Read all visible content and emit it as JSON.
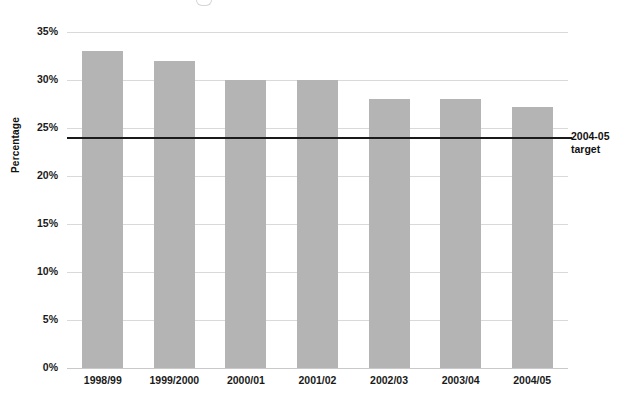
{
  "chart_data": {
    "type": "bar",
    "title": "",
    "xlabel": "",
    "ylabel": "Percentage",
    "categories": [
      "1998/99",
      "1999/2000",
      "2000/01",
      "2001/02",
      "2002/03",
      "2003/04",
      "2004/05"
    ],
    "values": [
      33,
      32,
      30,
      30,
      28,
      28,
      27.2
    ],
    "ylim": [
      0,
      35
    ],
    "ytick_labels": [
      "0%",
      "5%",
      "10%",
      "15%",
      "20%",
      "25%",
      "30%",
      "35%"
    ],
    "ytick_values": [
      0,
      5,
      10,
      15,
      20,
      25,
      30,
      35
    ],
    "grid": true,
    "legend": "none",
    "series": [
      {
        "name": "Percentage",
        "values": [
          33,
          32,
          30,
          30,
          28,
          28,
          27.2
        ]
      }
    ],
    "annotations": [
      {
        "type": "threshold-line",
        "label_line1": "2004-05",
        "label_line2": "target",
        "value": 24
      }
    ],
    "colors": {
      "bar_fill": "#b4b4b4",
      "gridline": "#d9d9d9",
      "target_line": "#1a1a1a",
      "text": "#1a1a1a",
      "background": "#ffffff"
    }
  }
}
